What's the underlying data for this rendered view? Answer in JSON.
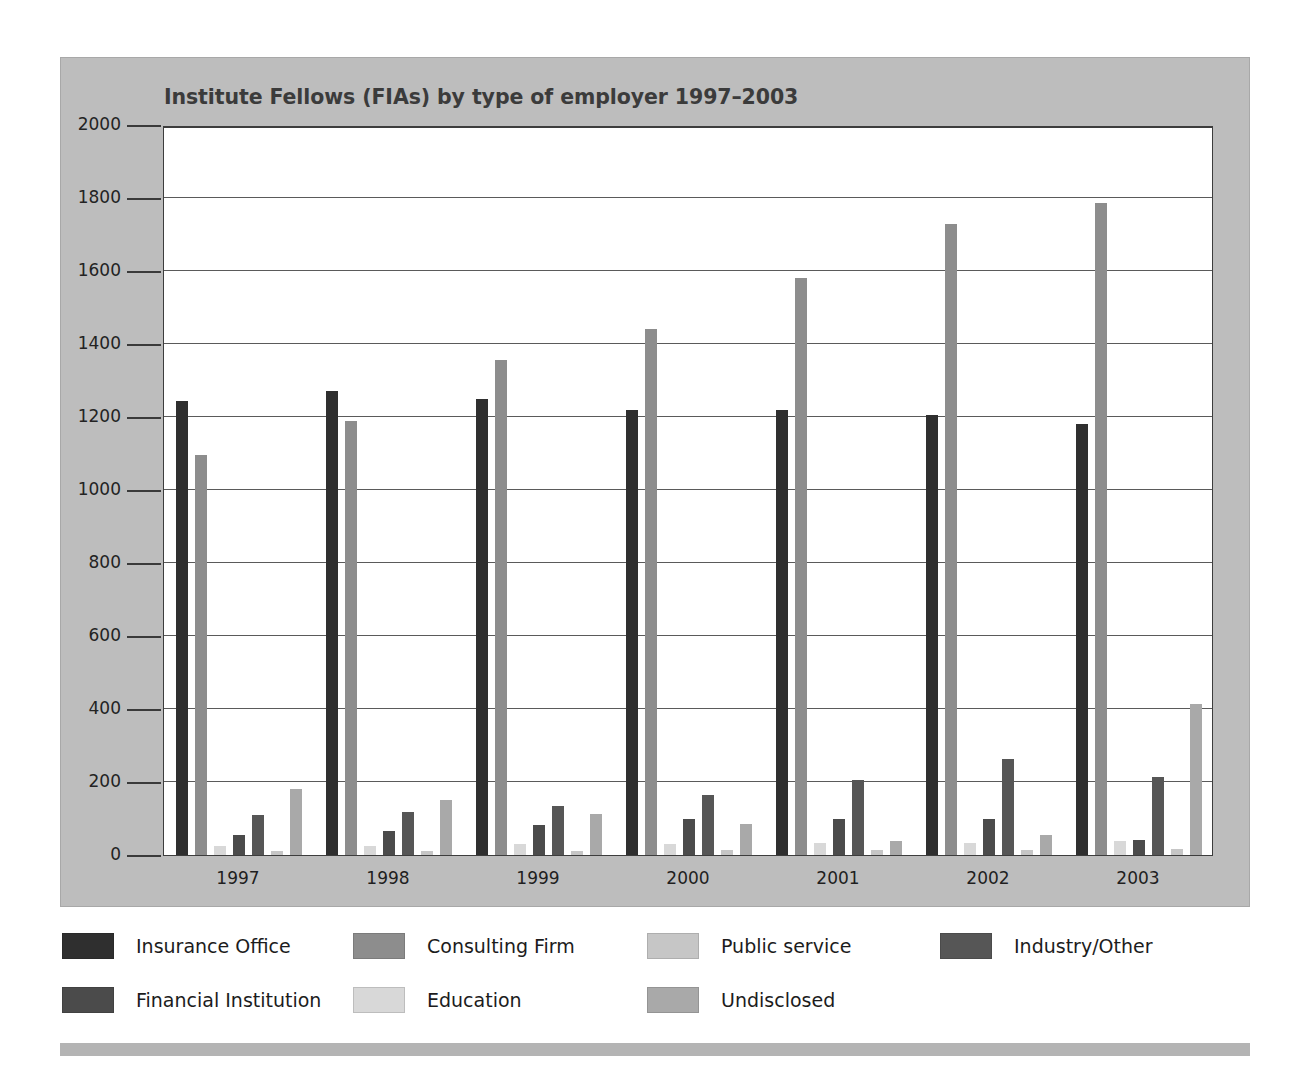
{
  "figure": {
    "background_color": "#bdbdbd",
    "plot_background_color": "#ffffff",
    "axis_color": "#3d3d3d"
  },
  "chart_data": {
    "type": "bar",
    "title": "Institute Fellows (FIAs) by type of employer 1997–2003",
    "xlabel": "",
    "ylabel": "",
    "ylim": [
      0,
      2000
    ],
    "ytick_step": 200,
    "yticks": [
      "2000",
      "1800",
      "1600",
      "1400",
      "1200",
      "1000",
      "800",
      "600",
      "400",
      "200",
      "0"
    ],
    "grid": true,
    "grid_axis": "y",
    "legend_position": "bottom",
    "categories": [
      "1997",
      "1998",
      "1999",
      "2000",
      "2001",
      "2002",
      "2003"
    ],
    "series": [
      {
        "name": "Insurance Office",
        "color": "#2f2f2f",
        "values": [
          1245,
          1270,
          1250,
          1220,
          1218,
          1205,
          1182
        ]
      },
      {
        "name": "Consulting Firm",
        "color": "#8d8d8d",
        "values": [
          1095,
          1188,
          1355,
          1440,
          1580,
          1730,
          1785
        ]
      },
      {
        "name": "Education",
        "color": "#d8d8d8",
        "values": [
          25,
          25,
          30,
          30,
          32,
          32,
          38
        ]
      },
      {
        "name": "Financial Institution",
        "color": "#4b4b4b",
        "values": [
          55,
          65,
          82,
          98,
          98,
          98,
          42
        ]
      },
      {
        "name": "Industry/Other",
        "color": "#565656",
        "values": [
          110,
          118,
          135,
          165,
          205,
          262,
          215
        ]
      },
      {
        "name": "Public service",
        "color": "#c6c6c6",
        "values": [
          12,
          12,
          12,
          14,
          14,
          14,
          16
        ]
      },
      {
        "name": "Undisclosed",
        "color": "#a9a9a9",
        "values": [
          180,
          152,
          112,
          86,
          38,
          55,
          415
        ]
      }
    ]
  },
  "legend": {
    "items": [
      {
        "label": "Insurance Office",
        "color": "#2f2f2f"
      },
      {
        "label": "Consulting Firm",
        "color": "#8d8d8d"
      },
      {
        "label": "Public service",
        "color": "#c6c6c6"
      },
      {
        "label": "Industry/Other",
        "color": "#565656"
      },
      {
        "label": "Financial Institution",
        "color": "#4b4b4b"
      },
      {
        "label": "Education",
        "color": "#d8d8d8"
      },
      {
        "label": "Undisclosed",
        "color": "#a9a9a9"
      }
    ]
  }
}
